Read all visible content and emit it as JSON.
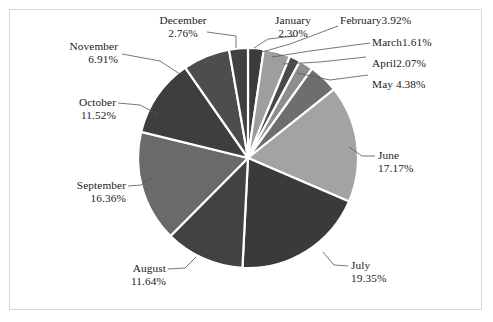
{
  "chart_data": {
    "type": "pie",
    "title": "",
    "subtitle": "",
    "xlabel": "",
    "ylabel": "",
    "legend_position": "none",
    "grid": false,
    "label_format": "category + percent",
    "start_angle_deg": 0,
    "direction": "clockwise",
    "categories": [
      "January",
      "February",
      "March",
      "April",
      "May",
      "June",
      "July",
      "August",
      "September",
      "October",
      "November",
      "December"
    ],
    "values": [
      2.3,
      3.92,
      1.61,
      2.07,
      4.38,
      17.17,
      19.35,
      11.64,
      16.36,
      11.52,
      6.91,
      2.76
    ],
    "value_unit": "%",
    "slices": [
      {
        "name": "January",
        "percent": 2.3,
        "percent_text": "2.30%",
        "label_text": "January",
        "color": "#3c3c3c"
      },
      {
        "name": "February",
        "percent": 3.92,
        "percent_text": "3.92%",
        "label_text": "February",
        "color": "#9e9e9e"
      },
      {
        "name": "March",
        "percent": 1.61,
        "percent_text": "1.61%",
        "label_text": "March",
        "color": "#4a4a4a"
      },
      {
        "name": "April",
        "percent": 2.07,
        "percent_text": "2.07%",
        "label_text": "April",
        "color": "#8e8e8e"
      },
      {
        "name": "May",
        "percent": 4.38,
        "percent_text": "4.38%",
        "label_text": "May",
        "color": "#6e6e6e"
      },
      {
        "name": "June",
        "percent": 17.17,
        "percent_text": "17.17%",
        "label_text": "June",
        "color": "#a3a3a3"
      },
      {
        "name": "July",
        "percent": 19.35,
        "percent_text": "19.35%",
        "label_text": "July",
        "color": "#3a3a3a"
      },
      {
        "name": "August",
        "percent": 11.64,
        "percent_text": "11.64%",
        "label_text": "August",
        "color": "#424242"
      },
      {
        "name": "September",
        "percent": 16.36,
        "percent_text": "16.36%",
        "label_text": "September",
        "color": "#6a6a6a"
      },
      {
        "name": "October",
        "percent": 11.52,
        "percent_text": "11.52%",
        "label_text": "October",
        "color": "#3e3e3e"
      },
      {
        "name": "November",
        "percent": 6.91,
        "percent_text": "6.91%",
        "label_text": "November",
        "color": "#4d4d4d"
      },
      {
        "name": "December",
        "percent": 2.76,
        "percent_text": "2.76%",
        "label_text": "December",
        "color": "#414141"
      }
    ],
    "separator_color": "#ffffff",
    "frame_color": "#d8d8d8",
    "background_color": "#ffffff",
    "text_color": "#1a1a1a"
  },
  "labels": {
    "december": {
      "line1": "December",
      "line2": "2.76%"
    },
    "january": {
      "line1": "January",
      "line2": "2.30%"
    },
    "february": {
      "line1": "February3.92%"
    },
    "march": {
      "line1": "March1.61%"
    },
    "april": {
      "line1": "April2.07%"
    },
    "may": {
      "line1": "May 4.38%"
    },
    "june": {
      "line1": "June",
      "line2": "17.17%"
    },
    "july": {
      "line1": "July",
      "line2": "19.35%"
    },
    "august": {
      "line1": "August",
      "line2": "11.64%"
    },
    "september": {
      "line1": "September",
      "line2": "16.36%"
    },
    "october": {
      "line1": "October",
      "line2": "11.52%"
    },
    "november": {
      "line1": "November",
      "line2": "6.91%"
    }
  }
}
